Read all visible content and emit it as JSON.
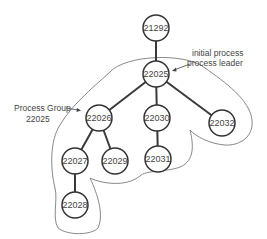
{
  "diagram": {
    "type": "process-tree",
    "nodes": [
      {
        "id": "21292",
        "label": "21292"
      },
      {
        "id": "22025",
        "label": "22025"
      },
      {
        "id": "22026",
        "label": "22026"
      },
      {
        "id": "22030",
        "label": "22030"
      },
      {
        "id": "22032",
        "label": "22032"
      },
      {
        "id": "22027",
        "label": "22027"
      },
      {
        "id": "22029",
        "label": "22029"
      },
      {
        "id": "22031",
        "label": "22031"
      },
      {
        "id": "22028",
        "label": "22028"
      }
    ],
    "edges": [
      {
        "from": "21292",
        "to": "22025"
      },
      {
        "from": "22025",
        "to": "22026"
      },
      {
        "from": "22025",
        "to": "22030"
      },
      {
        "from": "22025",
        "to": "22032"
      },
      {
        "from": "22026",
        "to": "22027"
      },
      {
        "from": "22026",
        "to": "22029"
      },
      {
        "from": "22030",
        "to": "22031"
      },
      {
        "from": "22027",
        "to": "22028"
      }
    ],
    "annotations": {
      "leader_line1": "initial process",
      "leader_line2": "process leader",
      "group_line1": "Process Group",
      "group_line2": "22025"
    }
  }
}
